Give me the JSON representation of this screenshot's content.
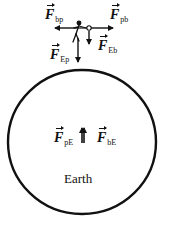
{
  "diagram": {
    "title": "",
    "colors": {
      "ink": "#111111",
      "background": "#ffffff"
    },
    "earth": {
      "label": "Earth",
      "shape": "circle",
      "center": [
        82,
        142
      ],
      "radius": [
        74,
        72
      ]
    },
    "objects": [
      {
        "id": "person",
        "description": "stick figure person",
        "position": [
          77,
          32
        ]
      },
      {
        "id": "ball",
        "description": "small circle object held by person",
        "position": [
          89,
          28
        ]
      }
    ],
    "forces": [
      {
        "id": "F_bp",
        "symbol": "F",
        "subscript": "bp",
        "direction": "left",
        "on": "person",
        "by": "ball"
      },
      {
        "id": "F_pb",
        "symbol": "F",
        "subscript": "pb",
        "direction": "right",
        "on": "ball",
        "by": "person"
      },
      {
        "id": "F_Eb",
        "symbol": "F",
        "subscript": "Eb",
        "direction": "down",
        "on": "ball",
        "by": "Earth"
      },
      {
        "id": "F_Ep",
        "symbol": "F",
        "subscript": "Ep",
        "direction": "down",
        "on": "person",
        "by": "Earth"
      },
      {
        "id": "F_pE",
        "symbol": "F",
        "subscript": "pE",
        "direction": "up",
        "on": "Earth",
        "by": "person"
      },
      {
        "id": "F_bE",
        "symbol": "F",
        "subscript": "bE",
        "direction": "up",
        "on": "Earth",
        "by": "ball"
      }
    ]
  }
}
